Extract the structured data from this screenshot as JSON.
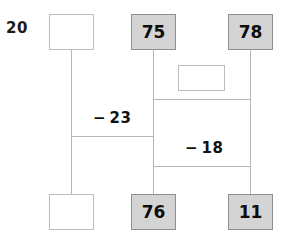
{
  "problem": {
    "number": "20"
  },
  "diagram": {
    "type": "subtraction-ladder-diagram",
    "nodes": [
      {
        "id": "top-left",
        "label": "",
        "filled": false
      },
      {
        "id": "top-middle",
        "label": "75",
        "filled": true
      },
      {
        "id": "top-right",
        "label": "78",
        "filled": true
      },
      {
        "id": "mid-center",
        "label": "",
        "filled": false
      },
      {
        "id": "bottom-left",
        "label": "",
        "filled": false
      },
      {
        "id": "bottom-middle",
        "label": "76",
        "filled": true
      },
      {
        "id": "bottom-right",
        "label": "11",
        "filled": true
      }
    ],
    "edge_labels": [
      {
        "id": "edge-label-left",
        "label": "− 23"
      },
      {
        "id": "edge-label-right",
        "label": "− 18"
      }
    ],
    "colors": {
      "filled_box_background": "#d4d4d4",
      "filled_box_border": "#8f8f8f",
      "empty_box_border": "#bdbdbd",
      "connector_line": "#b6b6b6",
      "text": "#111111"
    }
  }
}
